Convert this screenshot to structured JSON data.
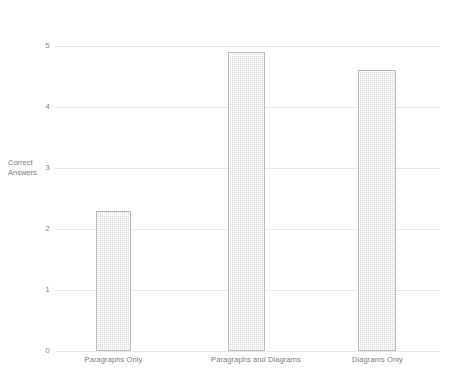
{
  "chart_data": {
    "type": "bar",
    "title": "",
    "xlabel": "",
    "ylabel": "Correct Answers",
    "ylabel_line1": "Correct",
    "ylabel_line2": "Answers",
    "categories": [
      "Paragraphs Only",
      "Paragraphs and Diagrams",
      "Diagrams Only"
    ],
    "values": [
      2.3,
      4.9,
      4.6
    ],
    "ylim": [
      0,
      5
    ],
    "yticks": [
      0,
      1,
      2,
      3,
      4,
      5
    ],
    "ytick_labels": [
      "0",
      "1",
      "2",
      "3",
      "4",
      "5"
    ],
    "grid": true,
    "legend": false,
    "legend_position": "none",
    "series": [
      {
        "name": "Correct Answers",
        "values": [
          2.3,
          4.9,
          4.6
        ]
      }
    ],
    "colors": {
      "bar_fill": "#d8d8d8",
      "bar_border": "#b9b9b9",
      "gridline": "#e9e9e9",
      "text": "#7d7d7d",
      "background": "#ffffff"
    }
  }
}
